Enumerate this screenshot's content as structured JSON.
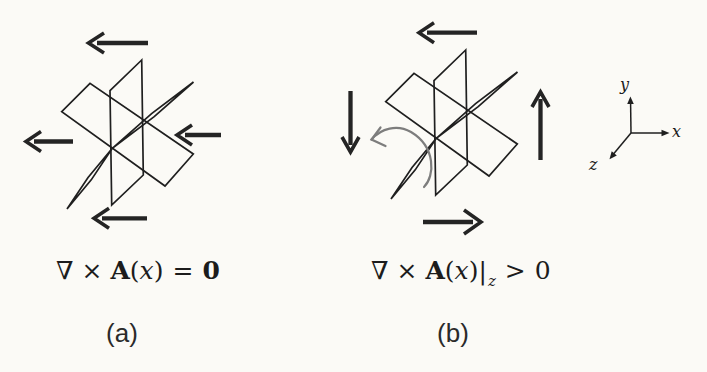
{
  "colors": {
    "background": "#fbfaf6",
    "ink": "#1f1f1f",
    "arrow": "#242424",
    "rotation": "#7d7d7d",
    "text": "#1c1c1c"
  },
  "panels": [
    {
      "caption": "(a)",
      "formula": {
        "nabla": "∇",
        "times": "×",
        "vector": "A",
        "open": "(",
        "variable": "x",
        "close": ")",
        "relation": "=",
        "value": "0"
      },
      "arrows": [
        {
          "position": "top",
          "direction": "left"
        },
        {
          "position": "left",
          "direction": "left"
        },
        {
          "position": "right",
          "direction": "left"
        },
        {
          "position": "bottom",
          "direction": "left"
        }
      ]
    },
    {
      "caption": "(b)",
      "formula": {
        "nabla": "∇",
        "times": "×",
        "vector": "A",
        "open": "(",
        "variable": "x",
        "close": ")",
        "bar": "|",
        "subscript": "z",
        "relation": ">",
        "value": "0"
      },
      "arrows": [
        {
          "position": "top",
          "direction": "left"
        },
        {
          "position": "left",
          "direction": "down"
        },
        {
          "position": "right",
          "direction": "up"
        },
        {
          "position": "bottom",
          "direction": "right"
        }
      ],
      "rotation_indicator": "counterclockwise"
    }
  ],
  "axes": {
    "x_label": "x",
    "y_label": "y",
    "z_label": "z"
  }
}
